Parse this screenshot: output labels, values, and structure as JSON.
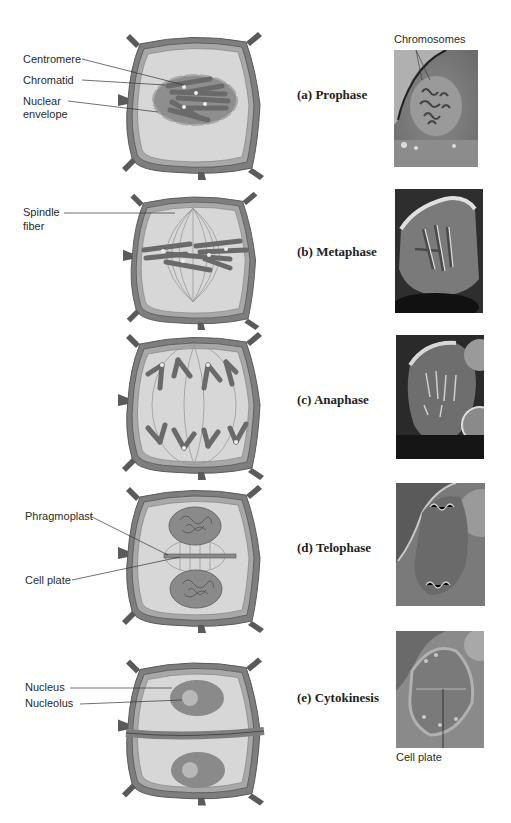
{
  "figure": {
    "colors": {
      "wall_outer": "#7a7a7a",
      "wall_inner": "#9c9c9c",
      "wall_dark": "#4a4a4a",
      "cytoplasm": "#d6d6d6",
      "nucleus": "#8c8c8c",
      "nucleolus": "#b8b8b8",
      "chromosome": "#6a6a6a",
      "spindle": "#9a9a9a",
      "centromere": "#eeeeee"
    },
    "stages": [
      {
        "id": "a",
        "phase_label": "(a) Prophase",
        "diagram_labels": [
          "Centromere",
          "Chromatid",
          "Nuclear",
          "envelope"
        ],
        "photo_label": "Chromosomes"
      },
      {
        "id": "b",
        "phase_label": "(b) Metaphase",
        "diagram_labels": [
          "Spindle",
          "fiber"
        ]
      },
      {
        "id": "c",
        "phase_label": "(c) Anaphase",
        "diagram_labels": []
      },
      {
        "id": "d",
        "phase_label": "(d) Telophase",
        "diagram_labels": [
          "Phragmoplast",
          "Cell plate"
        ]
      },
      {
        "id": "e",
        "phase_label": "(e) Cytokinesis",
        "diagram_labels": [
          "Nucleus",
          "Nucleolus"
        ],
        "photo_label": "Cell plate"
      }
    ]
  }
}
